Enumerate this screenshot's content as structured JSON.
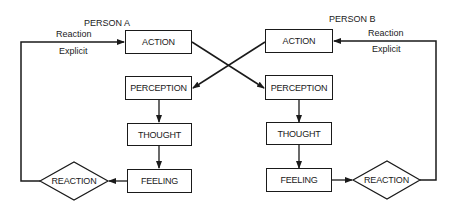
{
  "diagram": {
    "type": "flowchart",
    "person_a": {
      "title": "PERSON A",
      "action": "ACTION",
      "perception": "PERCEPTION",
      "thought": "THOUGHT",
      "feeling": "FEELING",
      "reaction": "REACTION",
      "feedback_label_top": "Reaction",
      "feedback_label_bottom": "Explicit"
    },
    "person_b": {
      "title": "PERSON B",
      "action": "ACTION",
      "perception": "PERCEPTION",
      "thought": "THOUGHT",
      "feeling": "FEELING",
      "reaction": "REACTION",
      "feedback_label_top": "Reaction",
      "feedback_label_bottom": "Explicit"
    },
    "edges": [
      "Person A ACTION -> Person B PERCEPTION",
      "Person B ACTION -> Person A PERCEPTION",
      "PERCEPTION -> THOUGHT",
      "THOUGHT -> FEELING",
      "FEELING -> REACTION",
      "REACTION -> ACTION (Explicit Reaction)"
    ],
    "colors": {
      "stroke": "#1a1a1a",
      "background": "#ffffff"
    }
  }
}
